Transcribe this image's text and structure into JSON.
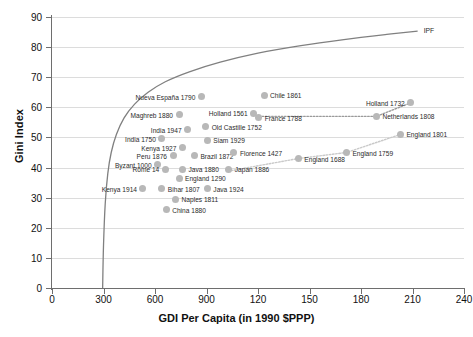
{
  "chart_data": {
    "type": "scatter",
    "title": "",
    "xlabel": "GDI Per Capita (in 1990 $PPP)",
    "ylabel": "Gini Index",
    "xlim": [
      0,
      2400
    ],
    "ylim": [
      0,
      90
    ],
    "grid": true,
    "legend": "none",
    "xticks": [
      {
        "value": 0,
        "label": "0"
      },
      {
        "value": 300,
        "label": "300"
      },
      {
        "value": 600,
        "label": "600"
      },
      {
        "value": 900,
        "label": "900"
      },
      {
        "value": 1200,
        "label": "120"
      },
      {
        "value": 1500,
        "label": "150"
      },
      {
        "value": 1800,
        "label": "180"
      },
      {
        "value": 2100,
        "label": "210"
      },
      {
        "value": 2400,
        "label": "240"
      }
    ],
    "yticks": [
      {
        "value": 0,
        "label": "0"
      },
      {
        "value": 10,
        "label": "10"
      },
      {
        "value": 20,
        "label": "20"
      },
      {
        "value": 30,
        "label": "30"
      },
      {
        "value": 40,
        "label": "40"
      },
      {
        "value": 50,
        "label": "50"
      },
      {
        "value": 60,
        "label": "60"
      },
      {
        "value": 70,
        "label": "70"
      },
      {
        "value": 80,
        "label": "80"
      },
      {
        "value": 90,
        "label": "90"
      }
    ],
    "curve": {
      "name": "IPF",
      "label": "IPF",
      "annotation_x": 2130,
      "annotation_y": 85.5,
      "color": "#808080",
      "points": [
        {
          "x": 295,
          "y": 0
        },
        {
          "x": 300,
          "y": 14
        },
        {
          "x": 310,
          "y": 28
        },
        {
          "x": 325,
          "y": 38
        },
        {
          "x": 345,
          "y": 45
        },
        {
          "x": 375,
          "y": 51
        },
        {
          "x": 420,
          "y": 56.5
        },
        {
          "x": 480,
          "y": 61
        },
        {
          "x": 560,
          "y": 65
        },
        {
          "x": 660,
          "y": 68.5
        },
        {
          "x": 800,
          "y": 71.8
        },
        {
          "x": 980,
          "y": 75
        },
        {
          "x": 1200,
          "y": 78
        },
        {
          "x": 1450,
          "y": 80.5
        },
        {
          "x": 1700,
          "y": 82.5
        },
        {
          "x": 1950,
          "y": 84.2
        },
        {
          "x": 2130,
          "y": 85.3
        }
      ]
    },
    "points": [
      {
        "name": "Nueva España 1790",
        "x": 870,
        "y": 63.5,
        "label_side": "left"
      },
      {
        "name": "Maghreb 1880",
        "x": 740,
        "y": 57.5,
        "label_side": "left"
      },
      {
        "name": "Old Castille 1752",
        "x": 895,
        "y": 53.5,
        "label_side": "right"
      },
      {
        "name": "India 1947",
        "x": 790,
        "y": 52.5,
        "label_side": "left"
      },
      {
        "name": "India 1750",
        "x": 640,
        "y": 49.5,
        "label_side": "left"
      },
      {
        "name": "Siam 1929",
        "x": 905,
        "y": 49.0,
        "label_side": "right"
      },
      {
        "name": "Kenya 1927",
        "x": 760,
        "y": 46.5,
        "label_side": "left"
      },
      {
        "name": "Peru 1876",
        "x": 705,
        "y": 44.0,
        "label_side": "left"
      },
      {
        "name": "Brazil 1872",
        "x": 830,
        "y": 44.0,
        "label_side": "right"
      },
      {
        "name": "Byzant 1000",
        "x": 615,
        "y": 41.0,
        "label_side": "left"
      },
      {
        "name": "Rome 14",
        "x": 660,
        "y": 39.5,
        "label_side": "left"
      },
      {
        "name": "Java 1880",
        "x": 760,
        "y": 39.5,
        "label_side": "right"
      },
      {
        "name": "England 1290",
        "x": 740,
        "y": 36.5,
        "label_side": "right"
      },
      {
        "name": "Kenya 1914",
        "x": 530,
        "y": 33.0,
        "label_side": "left"
      },
      {
        "name": "Bihar 1807",
        "x": 640,
        "y": 33.0,
        "label_side": "right"
      },
      {
        "name": "Java 1924",
        "x": 905,
        "y": 33.0,
        "label_side": "right"
      },
      {
        "name": "Naples 1811",
        "x": 720,
        "y": 29.5,
        "label_side": "right"
      },
      {
        "name": "China 1880",
        "x": 665,
        "y": 26.0,
        "label_side": "right"
      },
      {
        "name": "Japan 1886",
        "x": 1030,
        "y": 39.5,
        "label_side": "right"
      },
      {
        "name": "Florence 1427",
        "x": 1060,
        "y": 45.0,
        "label_side": "right"
      },
      {
        "name": "Chile 1861",
        "x": 1235,
        "y": 64.0,
        "label_side": "right"
      },
      {
        "name": "Holland 1561",
        "x": 1175,
        "y": 58.0,
        "label_side": "left"
      },
      {
        "name": "France 1788",
        "x": 1205,
        "y": 56.5,
        "label_side": "right"
      },
      {
        "name": "Netherlands 1808",
        "x": 1890,
        "y": 57.0,
        "label_side": "right"
      },
      {
        "name": "Holland 1732",
        "x": 2090,
        "y": 61.5,
        "label_side": "left"
      },
      {
        "name": "England 1688",
        "x": 1435,
        "y": 43.0,
        "label_side": "right"
      },
      {
        "name": "England 1759",
        "x": 1715,
        "y": 45.0,
        "label_side": "right"
      },
      {
        "name": "England 1801",
        "x": 2030,
        "y": 51.0,
        "label_side": "right"
      }
    ],
    "connectors": [
      {
        "name": "netherlands-series",
        "style": "dotted",
        "color": "#9a9a9a",
        "points": [
          {
            "x": 1205,
            "y": 57.0
          },
          {
            "x": 1890,
            "y": 57.0
          },
          {
            "x": 2090,
            "y": 61.5
          }
        ]
      },
      {
        "name": "england-series",
        "style": "dotted",
        "color": "#c9c9c9",
        "points": [
          {
            "x": 1045,
            "y": 39.0
          },
          {
            "x": 1435,
            "y": 43.0
          },
          {
            "x": 1715,
            "y": 45.0
          },
          {
            "x": 2030,
            "y": 51.0
          }
        ]
      }
    ]
  }
}
